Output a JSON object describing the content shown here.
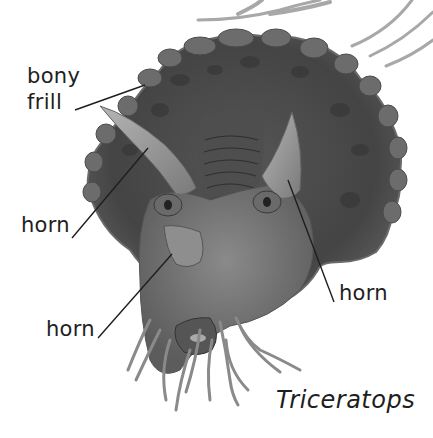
{
  "diagram": {
    "title": "Triceratops",
    "labels": [
      {
        "id": "bony-frill",
        "line1": "bony",
        "line2": "frill"
      },
      {
        "id": "brow-horn-left",
        "text": "horn"
      },
      {
        "id": "nose-horn",
        "text": "horn"
      },
      {
        "id": "brow-horn-right",
        "text": "horn"
      }
    ]
  },
  "colors": {
    "background": "#ffffff",
    "text": "#1e1e1e",
    "frill_dark": "#3c3c3c",
    "frill_mid": "#5a5a5a",
    "horn": "#9a9a9a",
    "face": "#727272",
    "grass": "#a8a8a8"
  }
}
